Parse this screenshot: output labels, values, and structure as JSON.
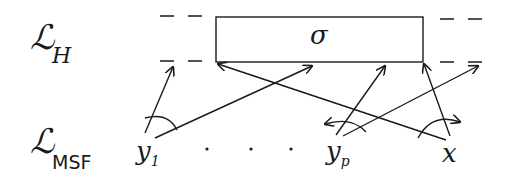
{
  "diagram": {
    "levels": {
      "top": {
        "symbol": "ℒ",
        "subscript": "H"
      },
      "bottom": {
        "symbol": "ℒ",
        "subscript": "MSF"
      }
    },
    "box": {
      "label": "σ"
    },
    "nodes": {
      "y1": {
        "name": "y",
        "subscript": "1"
      },
      "dots": "· · ·",
      "yp": {
        "name": "y",
        "subscript": "p"
      },
      "x": {
        "name": "x"
      }
    },
    "colors": {
      "ink": "#1a1a1a",
      "background": "#ffffff"
    }
  }
}
